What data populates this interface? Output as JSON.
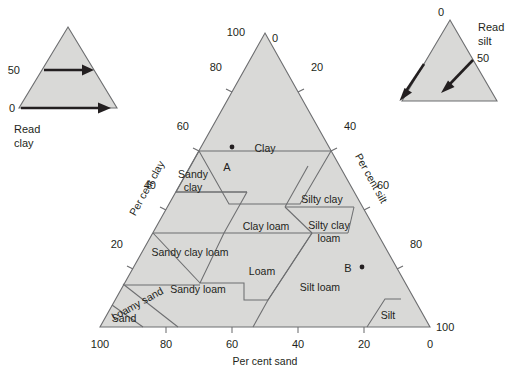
{
  "figure": {
    "type": "soil-texture-triangle",
    "cut_off_heading": "",
    "background": "#ffffff",
    "fill_color": "#d9d9d7",
    "line_color": "#6d6e70",
    "text_color": "#231f20"
  },
  "main_triangle": {
    "axes": [
      {
        "name": "clay",
        "label": "Per cent clay",
        "side": "left",
        "ticks": [
          "100",
          "80",
          "60",
          "40",
          "20"
        ]
      },
      {
        "name": "silt",
        "label": "Per cent silt",
        "side": "right",
        "ticks": [
          "0",
          "20",
          "40",
          "60",
          "80",
          "100"
        ]
      },
      {
        "name": "sand",
        "label": "Per cent sand",
        "side": "bottom",
        "ticks": [
          "100",
          "80",
          "60",
          "40",
          "20",
          "0"
        ]
      }
    ],
    "apex_labels": {
      "left": "100",
      "right": "0"
    },
    "left_ticks": [
      "100",
      "80",
      "60",
      "40",
      "20"
    ],
    "right_ticks": [
      "0",
      "20",
      "40",
      "60",
      "80",
      "100"
    ],
    "bottom_ticks": [
      "100",
      "80",
      "60",
      "40",
      "20",
      "0"
    ],
    "classes": [
      {
        "id": "clay",
        "label": "Clay"
      },
      {
        "id": "sandy-clay",
        "label": "Sandy\nclay"
      },
      {
        "id": "silty-clay",
        "label": "Silty clay"
      },
      {
        "id": "sandy-clay-loam",
        "label": "Sandy clay loam"
      },
      {
        "id": "clay-loam",
        "label": "Clay loam"
      },
      {
        "id": "silty-clay-loam",
        "label": "Silty clay\nloam"
      },
      {
        "id": "sandy-loam",
        "label": "Sandy loam"
      },
      {
        "id": "loam",
        "label": "Loam"
      },
      {
        "id": "silt-loam",
        "label": "Silt loam"
      },
      {
        "id": "loamy-sand",
        "label": "Loamy sand"
      },
      {
        "id": "sand",
        "label": "Sand"
      },
      {
        "id": "silt",
        "label": "Silt"
      }
    ],
    "class_labels": {
      "clay": "Clay",
      "sandy_clay_1": "Sandy",
      "sandy_clay_2": "clay",
      "silty_clay": "Silty clay",
      "sandy_clay_loam": "Sandy clay loam",
      "clay_loam": "Clay loam",
      "silty_clay_loam_1": "Silty clay",
      "silty_clay_loam_2": "loam",
      "sandy_loam": "Sandy loam",
      "loam": "Loam",
      "silt_loam": "Silt loam",
      "loamy_sand": "Loamy sand",
      "sand": "Sand",
      "silt": "Silt"
    },
    "sample_points": [
      {
        "label": "A",
        "clay": 55,
        "silt": 22,
        "sand": 23
      },
      {
        "label": "B",
        "clay": 17,
        "silt": 68,
        "sand": 15
      }
    ],
    "point_labels": {
      "a": "A",
      "b": "B"
    }
  },
  "inset_left": {
    "caption_line1": "Read",
    "caption_line2": "clay",
    "tick_upper": "50",
    "tick_lower": "0",
    "arrow_direction": "right"
  },
  "inset_right": {
    "caption_line1": "Read",
    "caption_line2": "silt",
    "tick_apex": "0",
    "tick_mid": "50",
    "arrow_direction": "down-left"
  }
}
